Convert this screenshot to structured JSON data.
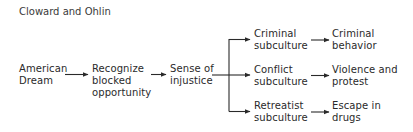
{
  "title": "Cloward and Ohlin",
  "nodes": {
    "american_dream": "American\nDream",
    "recognize_blocked": "Recognize\nblocked\nopportunity",
    "sense_of_injustice": "Sense of\ninjustice",
    "criminal_subculture": "Criminal\nsubculture",
    "conflict_subculture": "Conflict\nsubculture",
    "retreatist_subculture": "Retreatist\nsubculture",
    "criminal_behavior": "Criminal\nbehavior",
    "violence_protest": "Violence and\nprotest",
    "escape_drugs": "Escape in\ndrugs"
  },
  "edges": [
    [
      "american_dream",
      "recognize_blocked"
    ],
    [
      "recognize_blocked",
      "sense_of_injustice"
    ],
    [
      "sense_of_injustice",
      "criminal_subculture"
    ],
    [
      "sense_of_injustice",
      "conflict_subculture"
    ],
    [
      "sense_of_injustice",
      "retreatist_subculture"
    ],
    [
      "criminal_subculture",
      "criminal_behavior"
    ],
    [
      "conflict_subculture",
      "violence_protest"
    ],
    [
      "retreatist_subculture",
      "escape_drugs"
    ]
  ],
  "colors": {
    "ink": "#2a2a2a",
    "background": "#ffffff"
  }
}
